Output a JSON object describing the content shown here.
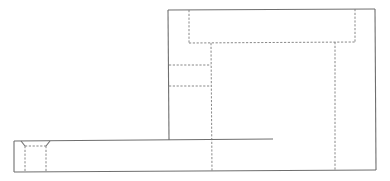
{
  "drawing": {
    "type": "orthographic-view",
    "line_colors": {
      "visible": "#6f6f6f",
      "hidden": "#7a7a7a"
    },
    "visible_lines": [
      {
        "name": "upright-left-edge",
        "x1": 168,
        "y1": 10,
        "x2": 169,
        "y2": 140
      },
      {
        "name": "upright-top-edge",
        "x1": 168,
        "y1": 10,
        "x2": 375,
        "y2": 9
      },
      {
        "name": "upright-right-edge",
        "x1": 375,
        "y1": 9,
        "x2": 376,
        "y2": 170
      },
      {
        "name": "base-top-edge",
        "x1": 14,
        "y1": 141,
        "x2": 273,
        "y2": 139
      },
      {
        "name": "base-left-edge",
        "x1": 14,
        "y1": 141,
        "x2": 14,
        "y2": 172
      },
      {
        "name": "base-bottom-edge",
        "x1": 14,
        "y1": 172,
        "x2": 376,
        "y2": 170
      },
      {
        "name": "countersink-left-chamfer",
        "x1": 21,
        "y1": 141,
        "x2": 25,
        "y2": 146
      },
      {
        "name": "countersink-right-chamfer",
        "x1": 50,
        "y1": 141,
        "x2": 46,
        "y2": 146
      }
    ],
    "hidden_lines": [
      {
        "name": "channel-left",
        "x1": 189,
        "y1": 10,
        "x2": 189,
        "y2": 43
      },
      {
        "name": "channel-bottom",
        "x1": 189,
        "y1": 43,
        "x2": 355,
        "y2": 42
      },
      {
        "name": "channel-right",
        "x1": 355,
        "y1": 9,
        "x2": 355,
        "y2": 42
      },
      {
        "name": "bore-left",
        "x1": 211,
        "y1": 43,
        "x2": 212,
        "y2": 171
      },
      {
        "name": "bore-right",
        "x1": 335,
        "y1": 42,
        "x2": 335,
        "y2": 170
      },
      {
        "name": "slot-top",
        "x1": 169,
        "y1": 65,
        "x2": 211,
        "y2": 65
      },
      {
        "name": "slot-bottom",
        "x1": 169,
        "y1": 86,
        "x2": 211,
        "y2": 86
      },
      {
        "name": "hole-top",
        "x1": 25,
        "y1": 146,
        "x2": 46,
        "y2": 146
      },
      {
        "name": "hole-left",
        "x1": 25,
        "y1": 146,
        "x2": 25,
        "y2": 172
      },
      {
        "name": "hole-right",
        "x1": 46,
        "y1": 146,
        "x2": 46,
        "y2": 172
      }
    ]
  }
}
